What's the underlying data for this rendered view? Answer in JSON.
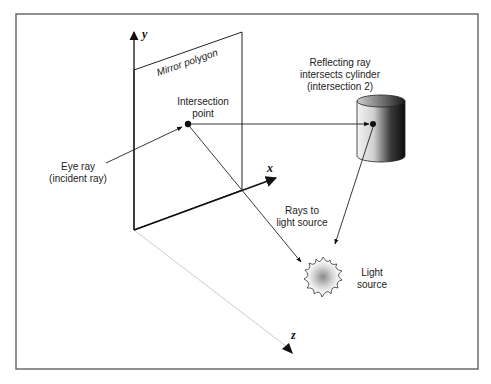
{
  "diagram": {
    "axes": {
      "x_label": "x",
      "y_label": "y",
      "z_label": "z"
    },
    "mirror": {
      "label": "Mirror polygon"
    },
    "labels": {
      "intersection_line1": "Intersection",
      "intersection_line2": "point",
      "eye_ray_line1": "Eye ray",
      "eye_ray_line2": "(incident ray)",
      "reflecting_line1": "Reflecting ray",
      "reflecting_line2": "intersects cylinder",
      "reflecting_line3": "(intersection 2)",
      "rays_line1": "Rays to",
      "rays_line2": "light source",
      "light_line1": "Light",
      "light_line2": "source"
    },
    "colors": {
      "frame": "#555555",
      "line": "#222222",
      "z_axis": "#cccccc",
      "cylinder_dark": "#111111",
      "cylinder_light": "#f4f4f4",
      "light_core": "#8a8a8a"
    }
  }
}
